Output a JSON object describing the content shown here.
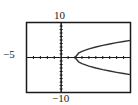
{
  "chart_data": {
    "type": "line",
    "title": "",
    "xlabel": "",
    "ylabel": "",
    "xlim": [
      -5,
      10
    ],
    "ylim": [
      -10,
      10
    ],
    "x_tick_step": 1,
    "y_tick_step": 1,
    "grid": false,
    "window_labels": {
      "ymax": "10",
      "ymin": "−10",
      "xmin": "−5"
    },
    "series": [
      {
        "name": "upper branch",
        "x": [
          2,
          2.5,
          3,
          4,
          5,
          6,
          7,
          8,
          9,
          10
        ],
        "y": [
          0,
          1.22,
          1.73,
          2.45,
          3.0,
          3.46,
          3.87,
          4.24,
          4.58,
          4.9
        ]
      },
      {
        "name": "lower branch",
        "x": [
          2,
          2.5,
          3,
          4,
          5,
          6,
          7,
          8,
          9,
          10
        ],
        "y": [
          0,
          -1.22,
          -1.73,
          -2.45,
          -3.0,
          -3.46,
          -3.87,
          -4.24,
          -4.58,
          -4.9
        ]
      }
    ],
    "annotations": [
      "Sideways parabola opening right, vertex at (2, 0)"
    ]
  },
  "labels": {
    "top": "10",
    "bottom": "−10",
    "left": "−5"
  },
  "colors": {
    "frame": "#1a1a1a",
    "curve": "#333333",
    "background": "#ffffff"
  }
}
